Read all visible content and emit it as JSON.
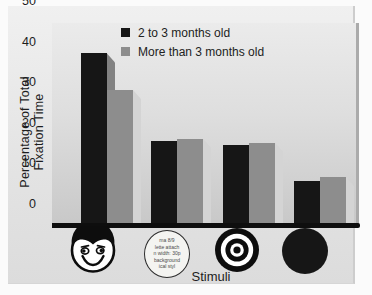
{
  "chart_data": {
    "type": "bar",
    "title": "",
    "categories": [
      "smiling face",
      "newsprint disc",
      "bullseye",
      "plain dark circle"
    ],
    "series": [
      {
        "name": "2 to 3 months old",
        "color": "#161616",
        "shadow_color": "#828282",
        "values": [
          42.5,
          21,
          20,
          11
        ]
      },
      {
        "name": "More than 3 months old",
        "color": "#8d8d8d",
        "shadow_color": "#d4d4d4",
        "values": [
          33.5,
          21.5,
          20.5,
          12
        ]
      }
    ],
    "xlabel": "Stimuli",
    "ylabel": "Percentage of Total Fixation Time",
    "ylim": [
      0,
      50
    ],
    "yticks": [
      0,
      10,
      20,
      30,
      40,
      50
    ],
    "grid": false,
    "legend_position": "inside-top"
  },
  "stimuli": {
    "newsprint_lines": [
      "ma 8/9",
      "lette attach",
      "n width: 30p",
      "background",
      "ical styl"
    ]
  }
}
